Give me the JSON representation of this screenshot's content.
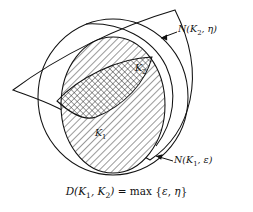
{
  "figure": {
    "kind": "geometric-diagram",
    "background_color": "#ffffff",
    "stroke_color": "#111111",
    "labels": {
      "outer_quadrilateral": "N(K₂, η)",
      "outer_ellipse": "N(K₁, ε)",
      "inner_ellipse": "K₁",
      "lens_region": "K₂",
      "formula": "D(K₁, K₂) = max {ε, η}"
    },
    "label_parts": {
      "n_k2": {
        "fn": "N",
        "open": "(",
        "base": "K",
        "sub": "2",
        "sep": ", ",
        "arg": "η",
        "close": ")"
      },
      "n_k1": {
        "fn": "N",
        "open": "(",
        "base": "K",
        "sub": "1",
        "sep": ", ",
        "arg": "ε",
        "close": ")"
      },
      "k1": {
        "base": "K",
        "sub": "1"
      },
      "k2": {
        "base": "K",
        "sub": "2"
      },
      "formula": {
        "d": "D",
        "open": "(",
        "k1_base": "K",
        "k1_sub": "1",
        "comma": ", ",
        "k2_base": "K",
        "k2_sub": "2",
        "close": ")",
        "equals": " = ",
        "max": "max",
        "set_open": " {",
        "eps": "ε",
        "set_comma": ", ",
        "eta": "η",
        "set_close": "}"
      }
    },
    "fills": {
      "k1_pattern": "diagonal-hatch",
      "overlap_pattern": "cross-hatch",
      "k2_outside_pattern": "diagonal-hatch",
      "neighbourhoods_pattern": "none"
    },
    "annotation_arrows": [
      {
        "name": "arrow-to-outer-quadrilateral",
        "points_to": "N(K₂, η)"
      },
      {
        "name": "arrow-to-outer-ellipse",
        "points_to": "N(K₁, ε)"
      }
    ]
  }
}
